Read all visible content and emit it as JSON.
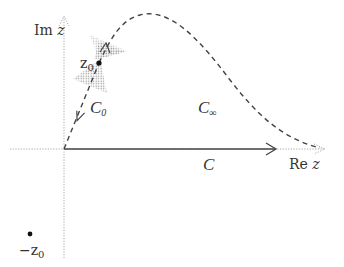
{
  "diagram": {
    "type": "complex-plane contour",
    "axes": {
      "real_label_main": "Re",
      "real_label_var": "z",
      "imag_label_main": "Im",
      "imag_label_var": "z"
    },
    "points": {
      "z0": {
        "label": "z",
        "sub": "0"
      },
      "minus_z0": {
        "label": "−z",
        "sub": "0"
      }
    },
    "contours": {
      "C": {
        "label": "C",
        "sub": ""
      },
      "C0": {
        "label": "C",
        "sub": "0"
      },
      "Cinf": {
        "label": "C",
        "sub": "∞"
      }
    },
    "colors": {
      "axis": "#aaaaaa",
      "contour": "#444444",
      "shade": "#999999"
    }
  }
}
